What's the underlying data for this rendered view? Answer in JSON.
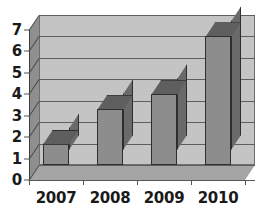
{
  "chart_data": {
    "type": "bar",
    "title": "",
    "subtitle": "",
    "xlabel": "",
    "ylabel": "",
    "categories": [
      "2007",
      "2008",
      "2009",
      "2010"
    ],
    "values": [
      1.0,
      2.6,
      3.3,
      6.0
    ],
    "series": [
      {
        "name": "",
        "values": [
          1.0,
          2.6,
          3.3,
          6.0
        ]
      }
    ],
    "ylim": [
      0,
      7
    ],
    "yticks": [
      0,
      1,
      2,
      3,
      4,
      5,
      6,
      7
    ],
    "ytick_labels": [
      "0",
      "1",
      "2",
      "3",
      "4",
      "5",
      "6",
      "7"
    ],
    "xtick_labels": [
      "2007",
      "2008",
      "2009",
      "2010"
    ],
    "grid": true,
    "grid_axis": "y",
    "legend": false,
    "legend_position": "none",
    "style": "3d",
    "annotations": []
  },
  "colors": {
    "page_background": "#ffffff",
    "back_wall": "#c4c4c4",
    "left_wall": "#8f8f8f",
    "floor": "#a5a5a5",
    "gridline": "#5e5e5e",
    "bar_front": "#8d8d8d",
    "bar_side": "#6a6a6a",
    "bar_top": "#5f5f5f",
    "bar_outline": "#2e2e2e",
    "axis_line": "#555555",
    "label_text": "#1a1a1a"
  }
}
